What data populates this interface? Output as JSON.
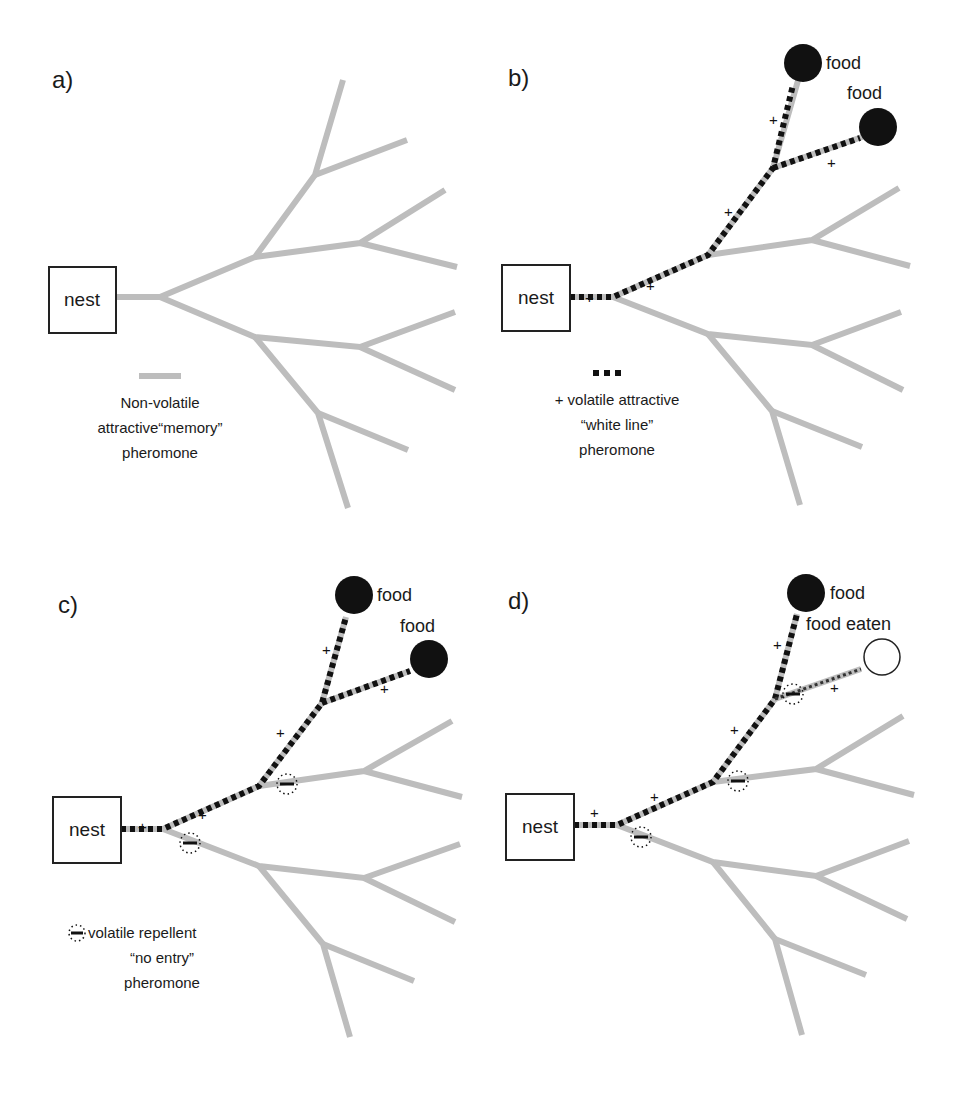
{
  "colors": {
    "branch": "#bdbdbd",
    "trail": "#111111",
    "food": "#111111",
    "nest_border": "#222222",
    "background": "#ffffff"
  },
  "legends": {
    "memory": {
      "lines": [
        "Non-volatile",
        "attractive“memory”",
        "pheromone"
      ]
    },
    "white_line": {
      "lines": [
        "+ volatile attractive",
        "“white line”",
        "pheromone"
      ]
    },
    "no_entry": {
      "lines": [
        "volatile repellent",
        "“no entry”",
        "pheromone"
      ]
    }
  },
  "panels": [
    {
      "id": "a",
      "label": "a)",
      "ox": 0,
      "oy": 0,
      "nest": "nest",
      "foods": [],
      "trails": [],
      "pluses": [],
      "repellents": [],
      "legend": "memory"
    },
    {
      "id": "b",
      "label": "b)",
      "ox": 0,
      "oy": 0,
      "nest": "nest",
      "foods": [
        {
          "label": "food",
          "state": "present",
          "cx": 803,
          "cy": 63,
          "lx": 826,
          "ly": 63
        },
        {
          "label": "food",
          "state": "present",
          "cx": 878,
          "cy": 127,
          "lx": 847,
          "ly": 100
        }
      ],
      "trails": [
        "trunk",
        "upper",
        "upper2",
        "tip-a",
        "tip-b"
      ],
      "pluses": [
        [
          590,
          303
        ],
        [
          651,
          291
        ],
        [
          729,
          217
        ],
        [
          775,
          125
        ],
        [
          832,
          169
        ]
      ],
      "repellents": [],
      "legend": "white_line"
    },
    {
      "id": "c",
      "label": "c)",
      "ox": 0,
      "oy": 0,
      "nest": "nest",
      "foods": [
        {
          "label": "food",
          "state": "present",
          "cx": 354,
          "cy": 595,
          "lx": 377,
          "ly": 595
        },
        {
          "label": "food",
          "state": "present",
          "cx": 429,
          "cy": 659,
          "lx": 400,
          "ly": 633
        }
      ],
      "trails": [
        "trunk",
        "upper",
        "upper2",
        "tip-a",
        "tip-b"
      ],
      "pluses": [
        [
          143,
          833
        ],
        [
          204,
          820
        ],
        [
          282,
          749
        ],
        [
          327,
          656
        ],
        [
          385,
          694
        ]
      ],
      "repellents": [
        [
          287,
          783
        ],
        [
          190,
          843
        ]
      ],
      "legend": "no_entry"
    },
    {
      "id": "d",
      "label": "d)",
      "ox": 0,
      "oy": 0,
      "nest": "nest",
      "foods": [
        {
          "label": "food",
          "state": "present",
          "cx": 806,
          "cy": 593,
          "lx": 830,
          "ly": 593
        },
        {
          "label": "food eaten",
          "state": "eaten",
          "cx": 882,
          "cy": 657,
          "lx": 806,
          "ly": 627
        }
      ],
      "trails": [
        "trunk",
        "upper",
        "upper2",
        "tip-a"
      ],
      "faint_trails": [
        "tip-b"
      ],
      "pluses": [
        [
          596,
          829
        ],
        [
          655,
          819
        ],
        [
          736,
          734
        ],
        [
          779,
          645
        ],
        [
          834,
          688
        ]
      ],
      "repellents": [
        [
          738,
          781
        ],
        [
          640,
          841
        ],
        [
          793,
          694
        ]
      ],
      "legend": null
    }
  ]
}
